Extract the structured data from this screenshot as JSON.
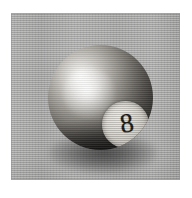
{
  "page": {
    "background_color": "#ffffff"
  },
  "photo": {
    "subject": "eight-ball",
    "alt_text": "Grayscale photograph of a billiard eight ball",
    "panel_background_color": "#a9a9a8",
    "panel": {
      "x": 11,
      "y": 13,
      "width": 169,
      "height": 167
    }
  },
  "ball": {
    "number": "8",
    "number_color": "#171614",
    "body_light_color": "#fbfbfa",
    "body_dark_color": "#0e0d0c",
    "spot_color": "#dedbd5",
    "shadow_color": "#141311",
    "diameter": 105,
    "center_x": 100,
    "center_y": 101,
    "highlight_x": 80,
    "highlight_y": 85,
    "spot_diameter": 47,
    "spot_center_x": 115,
    "spot_center_y": 124
  }
}
